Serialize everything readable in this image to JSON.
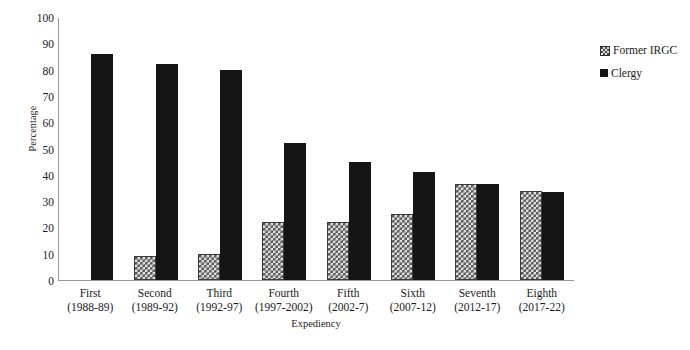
{
  "chart_data": {
    "type": "bar",
    "title": "",
    "xlabel": "Expediency",
    "ylabel": "Percentage",
    "ylim": [
      0,
      100
    ],
    "ytick_step": 10,
    "yticks": [
      100,
      90,
      80,
      70,
      60,
      50,
      40,
      30,
      20,
      10,
      0
    ],
    "grid": false,
    "legend_position": "right",
    "categories": [
      "First",
      "Second",
      "Third",
      "Fourth",
      "Fifth",
      "Sixth",
      "Seventh",
      "Eighth"
    ],
    "category_periods": [
      "(1988-89)",
      "(1989-92)",
      "(1992-97)",
      "(1997-2002)",
      "(2002-7)",
      "(2007-12)",
      "(2012-17)",
      "(2017-22)"
    ],
    "series": [
      {
        "name": "Former IRGC",
        "pattern": "checkered",
        "color": "#5e5e5e",
        "values": [
          0,
          9,
          10,
          22,
          22,
          25,
          36.5,
          34
        ]
      },
      {
        "name": "Clergy",
        "pattern": "solid",
        "color": "#151515",
        "values": [
          86,
          82,
          80,
          52,
          45,
          41,
          36.5,
          33.5
        ]
      }
    ]
  },
  "legend": {
    "items": [
      {
        "label": "Former IRGC",
        "swatch": "checkered-square-icon"
      },
      {
        "label": "Clergy",
        "swatch": "solid-square-icon"
      }
    ]
  },
  "axes": {
    "y_title": "Percentage",
    "x_title": "Expediency"
  }
}
